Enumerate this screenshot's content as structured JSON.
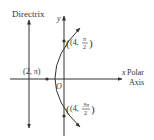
{
  "diagram": {
    "labels": {
      "directrix": "Directrix",
      "y_axis": "y",
      "x_axis": "x",
      "polar": "Polar",
      "axis": "Axis",
      "origin": "O"
    },
    "points": [
      {
        "name": "point-4-pi-over-2",
        "r": "4",
        "theta_num": "π",
        "theta_den": "2",
        "x": 64,
        "y": 41
      },
      {
        "name": "point-2-pi",
        "r": "2",
        "theta": "π",
        "text": "(2, π)",
        "x": 47,
        "y": 79
      },
      {
        "name": "point-4-3pi-over-2",
        "r": "4",
        "theta_num": "3π",
        "theta_den": "2",
        "x": 64,
        "y": 116
      }
    ],
    "point_labels": {
      "p1_r": "(4,",
      "p1_num": "π",
      "p1_den": "2",
      "p2": "(2, π)",
      "p3_r": "(4,",
      "p3_num": "3π",
      "p3_den": "2"
    },
    "colors": {
      "line": "#333333",
      "background": "#ffffff"
    }
  }
}
